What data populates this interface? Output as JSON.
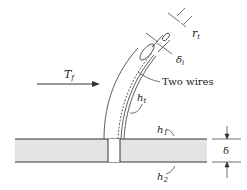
{
  "diagram": {
    "labels": {
      "flow_temp": "T",
      "flow_temp_sub": "f",
      "wire_radius": "r",
      "wire_radius_sub": "t",
      "insulation": "δ",
      "insulation_sub": "i",
      "wires": "Two wires",
      "h_wire": "h",
      "h_wire_sub": "t",
      "h_top": "h",
      "h_top_sub": "1",
      "h_bottom": "h",
      "h_bottom_sub": "2",
      "thickness": "δ"
    },
    "colors": {
      "plate_fill": "#e4e4e4",
      "line": "#333333",
      "background": "#ffffff"
    }
  }
}
